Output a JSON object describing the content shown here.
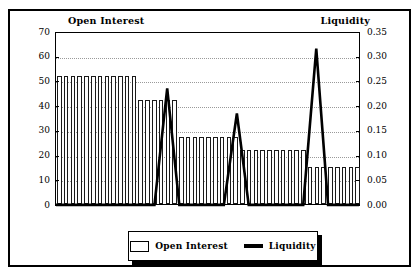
{
  "chart_data": {
    "type": "bar",
    "title": "",
    "subtitle": "",
    "grid": true,
    "legend_position": "bottom",
    "axes": {
      "left": {
        "label": "Open Interest",
        "min": 0,
        "max": 70,
        "step": 10,
        "ticks": [
          "0",
          "10",
          "20",
          "30",
          "40",
          "50",
          "60",
          "70"
        ]
      },
      "right": {
        "label": "Liquidity",
        "min": 0.0,
        "max": 0.35,
        "step": 0.05,
        "ticks": [
          "0.00",
          "0.05",
          "0.10",
          "0.15",
          "0.20",
          "0.25",
          "0.30",
          "0.35"
        ]
      },
      "x": {
        "label": "",
        "ticks": []
      }
    },
    "series": [
      {
        "name": "Open Interest",
        "type": "bar",
        "axis": "left",
        "style": {
          "fill": "#ffffff",
          "stroke": "#1a1a1a"
        },
        "groups": [
          {
            "value": 52,
            "count": 12
          },
          {
            "value": 42,
            "count": 6
          },
          {
            "value": 27,
            "count": 9
          },
          {
            "value": 22,
            "count": 10
          },
          {
            "value": 15,
            "count": 8
          }
        ],
        "values": [
          52,
          52,
          52,
          52,
          52,
          52,
          52,
          52,
          52,
          52,
          52,
          52,
          42,
          42,
          42,
          42,
          42,
          42,
          27,
          27,
          27,
          27,
          27,
          27,
          27,
          27,
          27,
          22,
          22,
          22,
          22,
          22,
          22,
          22,
          22,
          22,
          22,
          15,
          15,
          15,
          15,
          15,
          15,
          15,
          15
        ]
      },
      {
        "name": "Liquidity",
        "type": "line",
        "axis": "right",
        "style": {
          "stroke": "#000000",
          "width": 2.6
        },
        "peaks": [
          {
            "position_pct": 36.7,
            "value": 0.237
          },
          {
            "position_pct": 59.7,
            "value": 0.186
          },
          {
            "position_pct": 85.9,
            "value": 0.318
          }
        ],
        "baseline": 0.0,
        "points": [
          {
            "x_pct": 0.0,
            "y": 0.0
          },
          {
            "x_pct": 32.5,
            "y": 0.0
          },
          {
            "x_pct": 36.7,
            "y": 0.237
          },
          {
            "x_pct": 40.7,
            "y": 0.0
          },
          {
            "x_pct": 55.4,
            "y": 0.0
          },
          {
            "x_pct": 59.7,
            "y": 0.186
          },
          {
            "x_pct": 63.6,
            "y": 0.0
          },
          {
            "x_pct": 81.6,
            "y": 0.0
          },
          {
            "x_pct": 85.9,
            "y": 0.318
          },
          {
            "x_pct": 89.8,
            "y": 0.0
          },
          {
            "x_pct": 100.0,
            "y": 0.0
          }
        ]
      }
    ]
  },
  "legend": {
    "items": [
      {
        "label": "Open Interest",
        "marker": "bar-swatch"
      },
      {
        "label": "Liquidity",
        "marker": "line-swatch"
      }
    ]
  },
  "colors": {
    "background": "#ffffff",
    "frame": "#000000",
    "bar_stroke": "#1a1a1a",
    "bar_fill": "#ffffff",
    "line": "#000000",
    "gridline": "#9a9a9a",
    "text": "#000000"
  }
}
